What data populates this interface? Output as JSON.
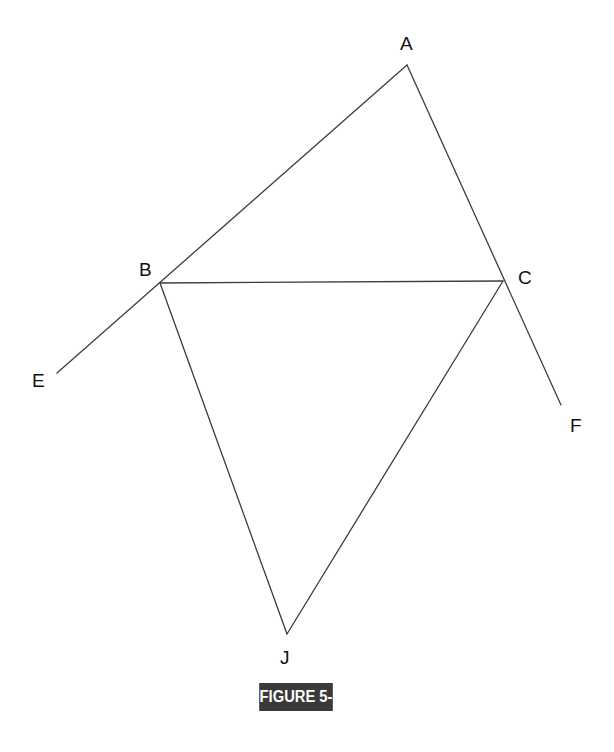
{
  "diagram": {
    "type": "geometry-construction",
    "points": {
      "A": {
        "label": "A"
      },
      "B": {
        "label": "B"
      },
      "C": {
        "label": "C"
      },
      "E": {
        "label": "E"
      },
      "F": {
        "label": "F"
      },
      "J": {
        "label": "J"
      }
    },
    "segments": [
      {
        "name": "ray-A-through-B-to-E",
        "from": "A",
        "to": "E",
        "through": "B"
      },
      {
        "name": "ray-A-through-C-to-F",
        "from": "A",
        "to": "F",
        "through": "C"
      },
      {
        "name": "segment-BC",
        "from": "B",
        "to": "C"
      },
      {
        "name": "segment-BJ",
        "from": "B",
        "to": "J"
      },
      {
        "name": "segment-CJ",
        "from": "C",
        "to": "J"
      }
    ],
    "line_color": "#3c3c3c"
  },
  "caption": {
    "text": "FIGURE 5-8",
    "background": "#3a3a3a",
    "color": "#ffffff"
  }
}
